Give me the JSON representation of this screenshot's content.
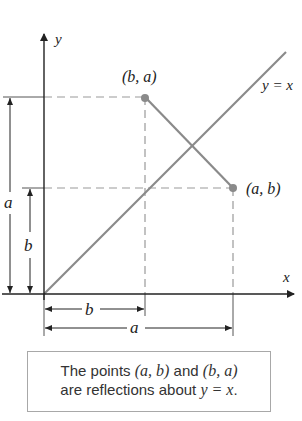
{
  "diagram": {
    "axes": {
      "x_label": "x",
      "y_label": "y"
    },
    "line_label": "y = x",
    "points": [
      {
        "label": "(b, a)",
        "role": "reflected-point"
      },
      {
        "label": "(a, b)",
        "role": "original-point"
      }
    ],
    "dimensions": {
      "vertical_a": "a",
      "vertical_b": "b",
      "horizontal_b": "b",
      "horizontal_a": "a"
    },
    "colors": {
      "axis": "#222222",
      "line": "#8a8a8a",
      "dashed": "#9a9a9a",
      "point": "#8a8a8a"
    }
  },
  "caption": {
    "line1_pre": "The points ",
    "line1_p1": "(a, b)",
    "line1_mid": " and ",
    "line1_p2": "(b, a)",
    "line2_pre": "are reflections about ",
    "line2_eq": "y = x",
    "line2_post": "."
  }
}
